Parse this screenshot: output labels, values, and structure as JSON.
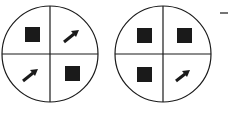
{
  "diagram": {
    "stroke_color": "#1a1a1a",
    "fill_color": "#1a1a1a",
    "background": "#ffffff",
    "circles": [
      {
        "name": "circle-1",
        "cx": 50,
        "cy": 54,
        "r": 48,
        "quadrants": {
          "top_left": "square",
          "top_right": "arrow-up-right",
          "bottom_left": "arrow-up-right",
          "bottom_right": "square"
        }
      },
      {
        "name": "circle-2",
        "cx": 163,
        "cy": 54,
        "r": 48,
        "quadrants": {
          "top_left": "square",
          "top_right": "square",
          "bottom_left": "square",
          "bottom_right": "arrow-up-right"
        }
      }
    ],
    "trailing_mark": "dash"
  }
}
